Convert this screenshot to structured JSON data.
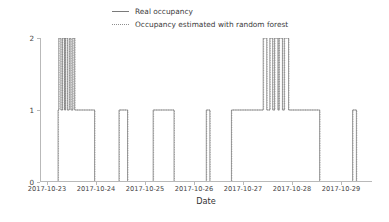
{
  "chart_data": {
    "type": "line",
    "title": "",
    "xlabel": "Date",
    "ylabel": "Occupancy",
    "grid": false,
    "legend_position": "top-center",
    "ylim": [
      0,
      2
    ],
    "yticks": [
      0,
      1,
      2
    ],
    "ytick_labels": [
      "0",
      "1",
      "2"
    ],
    "xlim": [
      "2017-10-22 18:00",
      "2017-10-29 06:00"
    ],
    "xticks": [
      "2017-10-23",
      "2017-10-24",
      "2017-10-25",
      "2017-10-26",
      "2017-10-27",
      "2017-10-28",
      "2017-10-29"
    ],
    "xtick_labels": [
      "2017-10-23",
      "2017-10-24",
      "2017-10-25",
      "2017-10-26",
      "2017-10-27",
      "2017-10-28",
      "2017-10-29"
    ],
    "series": [
      {
        "name": "Real occupancy",
        "style": "solid",
        "color": "#6b6b6b",
        "drawstyle": "steps-post",
        "x": [
          0.0,
          3.6,
          3.75,
          4.0,
          4.2,
          4.35,
          4.55,
          4.75,
          4.95,
          5.15,
          5.3,
          5.55,
          5.7,
          5.95,
          6.1,
          6.3,
          6.5,
          6.7,
          6.9,
          7.1,
          7.35,
          11.1,
          11.3,
          16.2,
          16.45,
          18.0,
          18.25,
          21.3,
          23.4,
          23.65,
          27.8,
          28.05,
          28.9,
          34.6,
          34.85,
          35.35,
          35.6,
          39.9,
          40.15,
          46.6,
          46.85,
          47.35,
          47.6,
          47.95,
          48.25,
          48.6,
          48.85,
          49.25,
          49.5,
          49.95,
          50.2,
          50.6,
          50.9,
          51.3,
          51.6,
          52.2,
          58.5,
          58.75,
          65.4,
          65.7,
          66.5
        ],
        "y": [
          0,
          1,
          2,
          2,
          1,
          1,
          2,
          2,
          1,
          2,
          2,
          1,
          1,
          2,
          2,
          1,
          1,
          2,
          2,
          1,
          1,
          1,
          0,
          0,
          1,
          1,
          0,
          0,
          0,
          1,
          1,
          0,
          0,
          0,
          1,
          1,
          0,
          0,
          1,
          1,
          2,
          2,
          1,
          1,
          2,
          2,
          1,
          2,
          2,
          1,
          2,
          2,
          1,
          2,
          2,
          1,
          1,
          0,
          0,
          1,
          0
        ],
        "note": "real occupancy square-wave, values 0/1/2 over 2017-10-23 .. 2017-10-29"
      },
      {
        "name": "Occupancy estimated with random forest",
        "style": "dotted",
        "color": "#9a9a9a",
        "drawstyle": "steps-post",
        "x": [
          0.0,
          3.7,
          3.85,
          4.05,
          4.25,
          4.45,
          4.6,
          4.8,
          5.0,
          5.2,
          5.4,
          5.6,
          5.8,
          6.0,
          6.2,
          6.4,
          6.6,
          6.8,
          7.0,
          7.2,
          7.45,
          11.2,
          11.4,
          16.3,
          16.55,
          18.1,
          18.35,
          21.4,
          23.5,
          23.75,
          27.9,
          28.15,
          29.0,
          34.7,
          34.95,
          35.45,
          35.7,
          40.0,
          40.25,
          46.7,
          46.95,
          47.45,
          47.7,
          48.05,
          48.35,
          48.7,
          48.95,
          49.35,
          49.6,
          50.05,
          50.3,
          50.7,
          51.0,
          51.4,
          51.7,
          52.3,
          58.6,
          58.85,
          65.5,
          65.8,
          66.6
        ],
        "y": [
          0,
          1,
          2,
          2,
          1,
          1,
          2,
          2,
          1,
          2,
          2,
          1,
          1,
          2,
          2,
          1,
          1,
          2,
          2,
          1,
          1,
          1,
          0,
          0,
          1,
          1,
          0,
          0,
          0,
          1,
          1,
          0,
          0,
          0,
          1,
          1,
          0,
          0,
          1,
          1,
          2,
          2,
          1,
          1,
          2,
          2,
          1,
          2,
          2,
          1,
          2,
          2,
          1,
          2,
          2,
          1,
          1,
          0,
          0,
          1,
          0
        ],
        "note": "random forest prediction, nearly identical to real occupancy with slight lag"
      }
    ]
  },
  "legend": {
    "entries": [
      {
        "label": "Real occupancy",
        "style": "solid"
      },
      {
        "label": "Occupancy estimated with random forest",
        "style": "dotted"
      }
    ]
  },
  "axes": {
    "ylabel": "Occupancy",
    "xlabel": "Date",
    "ytick_labels": [
      "2",
      "1",
      "0"
    ],
    "xtick_labels": [
      "2017-10-23",
      "2017-10-24",
      "2017-10-25",
      "2017-10-26",
      "2017-10-27",
      "2017-10-28",
      "2017-10-29"
    ]
  },
  "colors": {
    "real": "#6b6b6b",
    "estimated": "#9a9a9a",
    "axis": "#b9b9b9",
    "text": "#3b3b3b",
    "background": "#ffffff"
  }
}
